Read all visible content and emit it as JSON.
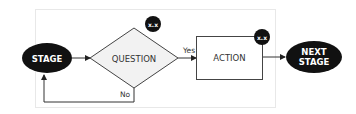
{
  "diagram": {
    "type": "flowchart",
    "nodes": {
      "stage": {
        "label": "STAGE",
        "shape": "ellipse",
        "fill": "#111111",
        "text_color": "#ffffff"
      },
      "question": {
        "label": "QUESTION",
        "shape": "diamond",
        "fill": "#f2f2f2",
        "stroke": "#333333",
        "badge": "x.x"
      },
      "action": {
        "label": "ACTION",
        "shape": "rectangle",
        "fill": "#ffffff",
        "stroke": "#333333",
        "badge": "x.x"
      },
      "next_stage": {
        "label_line1": "NEXT",
        "label_line2": "STAGE",
        "shape": "ellipse",
        "fill": "#111111",
        "text_color": "#ffffff"
      }
    },
    "edges": {
      "yes": {
        "from": "question",
        "to": "action",
        "label": "Yes"
      },
      "no": {
        "from": "question",
        "to": "stage",
        "label": "No"
      },
      "stage_to_question": {
        "from": "stage",
        "to": "question",
        "label": ""
      },
      "action_to_next": {
        "from": "action",
        "to": "next_stage",
        "label": ""
      }
    },
    "background_panel": {
      "fill": "#ffffff",
      "border": "#e6e6e6"
    }
  }
}
